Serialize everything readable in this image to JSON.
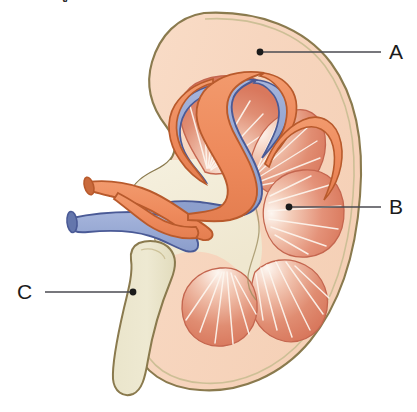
{
  "figure": {
    "kind": "anatomical-diagram",
    "cropped_title_fragment": "y"
  },
  "labels": [
    {
      "id": "A",
      "text": "A",
      "target": "renal-cortex",
      "dot_x": 260,
      "dot_y": 52,
      "line_end_x": 381,
      "line_end_y": 52
    },
    {
      "id": "B",
      "text": "B",
      "target": "renal-pyramid-medulla",
      "dot_x": 289,
      "dot_y": 207,
      "line_end_x": 381,
      "line_end_y": 207
    },
    {
      "id": "C",
      "text": "C",
      "target": "ureter",
      "dot_x": 133,
      "dot_y": 292,
      "line_end_x": 45,
      "line_end_y": 292
    }
  ],
  "colors": {
    "background": "#ffffff",
    "capsule_outline": "#8a7a4e",
    "cortex_fill": "#f7d7c0",
    "cortex_fill_light": "#fbe4d3",
    "sinus_fill": "#f3ecd8",
    "pyramid_fill": "#e1856c",
    "pyramid_fill_pale": "#fdf3ec",
    "pyramid_outline": "#c0624c",
    "artery_fill": "#ef8d5f",
    "artery_outline": "#b85a2c",
    "artery_lumen": "#c96a3c",
    "vein_fill": "#9aabd5",
    "vein_outline": "#4a5a96",
    "vein_lumen": "#6476ac",
    "ureter_fill": "#e9e4c8",
    "ureter_outline": "#8a7a4e",
    "striation": "#fdf6ef",
    "leader_line": "#4a4a50",
    "label_text": "#1b1b1b"
  },
  "structures": [
    {
      "name": "renal-capsule",
      "label": "A-outer-boundary"
    },
    {
      "name": "renal-cortex",
      "label": "A"
    },
    {
      "name": "renal-medulla-pyramid-upper",
      "label": "B-group"
    },
    {
      "name": "renal-medulla-pyramid-right",
      "label": "B"
    },
    {
      "name": "renal-medulla-pyramid-lower-left",
      "label": "B-group"
    },
    {
      "name": "renal-medulla-pyramid-lower-right",
      "label": "B-group"
    },
    {
      "name": "renal-sinus",
      "label": "hilum-fat"
    },
    {
      "name": "renal-artery",
      "label": "artery"
    },
    {
      "name": "renal-vein",
      "label": "vein"
    },
    {
      "name": "ureter",
      "label": "C"
    }
  ]
}
